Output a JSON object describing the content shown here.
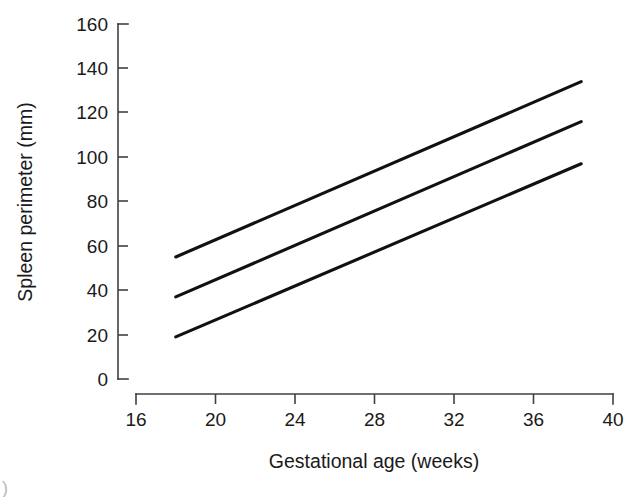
{
  "chart_data": {
    "type": "line",
    "title": "",
    "subtitle": "",
    "xlabel": "Gestational age (weeks)",
    "ylabel": "Spleen perimeter (mm)",
    "xlim": [
      16,
      40
    ],
    "ylim": [
      0,
      160
    ],
    "xticks": [
      16,
      20,
      24,
      28,
      32,
      36,
      40
    ],
    "yticks": [
      0,
      20,
      40,
      60,
      80,
      100,
      120,
      140,
      160
    ],
    "xtick_labels": [
      "16",
      "20",
      "24",
      "28",
      "32",
      "36",
      "40"
    ],
    "ytick_labels": [
      "0",
      "20",
      "40",
      "60",
      "80",
      "100",
      "120",
      "140",
      "160"
    ],
    "grid": false,
    "legend": null,
    "legend_position": "none",
    "line_color": "#111111",
    "axis_color": "#404040",
    "x": [
      18,
      38.4
    ],
    "series": [
      {
        "name": "upper",
        "values": [
          55,
          134
        ]
      },
      {
        "name": "median",
        "values": [
          37,
          116
        ]
      },
      {
        "name": "lower",
        "values": [
          19,
          97
        ]
      }
    ],
    "annotations": []
  },
  "figure": {
    "corner_mark": ")"
  }
}
